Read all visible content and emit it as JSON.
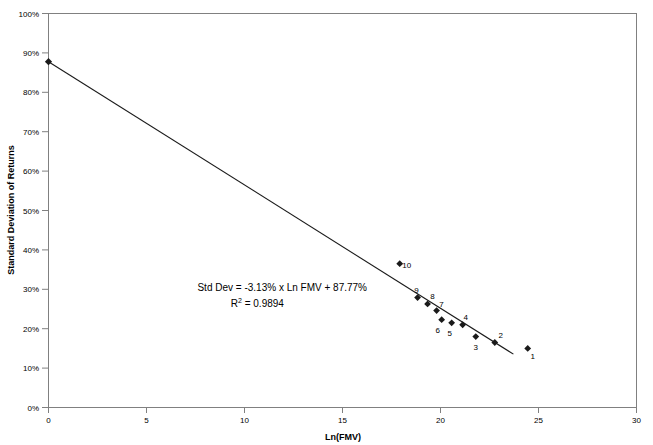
{
  "chart_data": {
    "type": "scatter",
    "title": "",
    "xlabel": "Ln(FMV)",
    "ylabel": "Standard Deviation of Returns",
    "xlim": [
      0,
      30
    ],
    "ylim": [
      0,
      1.0
    ],
    "grid": false,
    "legend": "none",
    "x_ticks": [
      "0",
      "5",
      "10",
      "15",
      "20",
      "25",
      "30"
    ],
    "x_tick_values": [
      0,
      5,
      10,
      15,
      20,
      25,
      30
    ],
    "y_ticks": [
      "0%",
      "10%",
      "20%",
      "30%",
      "40%",
      "50%",
      "60%",
      "70%",
      "80%",
      "90%",
      "100%"
    ],
    "y_tick_values": [
      0,
      0.1,
      0.2,
      0.3,
      0.4,
      0.5,
      0.6,
      0.7,
      0.8,
      0.9,
      1.0
    ],
    "annotations": [
      {
        "name": "regression-equation",
        "text": "Std Dev = -3.13% x Ln FMV + 87.77%",
        "x": 7.6,
        "y": 0.295
      },
      {
        "name": "r-squared-base",
        "text": "R",
        "text_sup": "2",
        "text_rest": " = 0.9894",
        "x": 9.3,
        "y": 0.255
      }
    ],
    "series": [
      {
        "name": "Observed companies",
        "marker": "diamond",
        "color": "#1a1a1a",
        "points": [
          {
            "label": "1",
            "x": 24.45,
            "y": 0.15
          },
          {
            "label": "2",
            "x": 22.77,
            "y": 0.165
          },
          {
            "label": "3",
            "x": 21.8,
            "y": 0.18
          },
          {
            "label": "4",
            "x": 21.13,
            "y": 0.21
          },
          {
            "label": "5",
            "x": 20.57,
            "y": 0.215
          },
          {
            "label": "6",
            "x": 20.06,
            "y": 0.223
          },
          {
            "label": "7",
            "x": 19.8,
            "y": 0.246
          },
          {
            "label": "8",
            "x": 19.34,
            "y": 0.263
          },
          {
            "label": "9",
            "x": 18.83,
            "y": 0.279
          },
          {
            "label": "10",
            "x": 17.92,
            "y": 0.365
          }
        ],
        "label_offsets": [
          {
            "label": "1",
            "dx": 5,
            "dy": 11
          },
          {
            "label": "2",
            "dx": 6,
            "dy": -4
          },
          {
            "label": "3",
            "dx": 0,
            "dy": 13
          },
          {
            "label": "4",
            "dx": 3,
            "dy": -5
          },
          {
            "label": "5",
            "dx": -2,
            "dy": 13
          },
          {
            "label": "6",
            "dx": -4,
            "dy": 13
          },
          {
            "label": "7",
            "dx": 5,
            "dy": -4
          },
          {
            "label": "8",
            "dx": 5,
            "dy": -5
          },
          {
            "label": "9",
            "dx": -1,
            "dy": -5
          },
          {
            "label": "10",
            "dx": 7,
            "dy": 4
          }
        ]
      }
    ],
    "trend_line": {
      "name": "regression-line",
      "slope_pct_per_ln": -3.13,
      "intercept_pct": 87.77,
      "x_start": 0,
      "y_start": 0.8777,
      "x_end": 23.72,
      "y_end": 0.1354,
      "endpoint_marker_at_start": true
    }
  }
}
